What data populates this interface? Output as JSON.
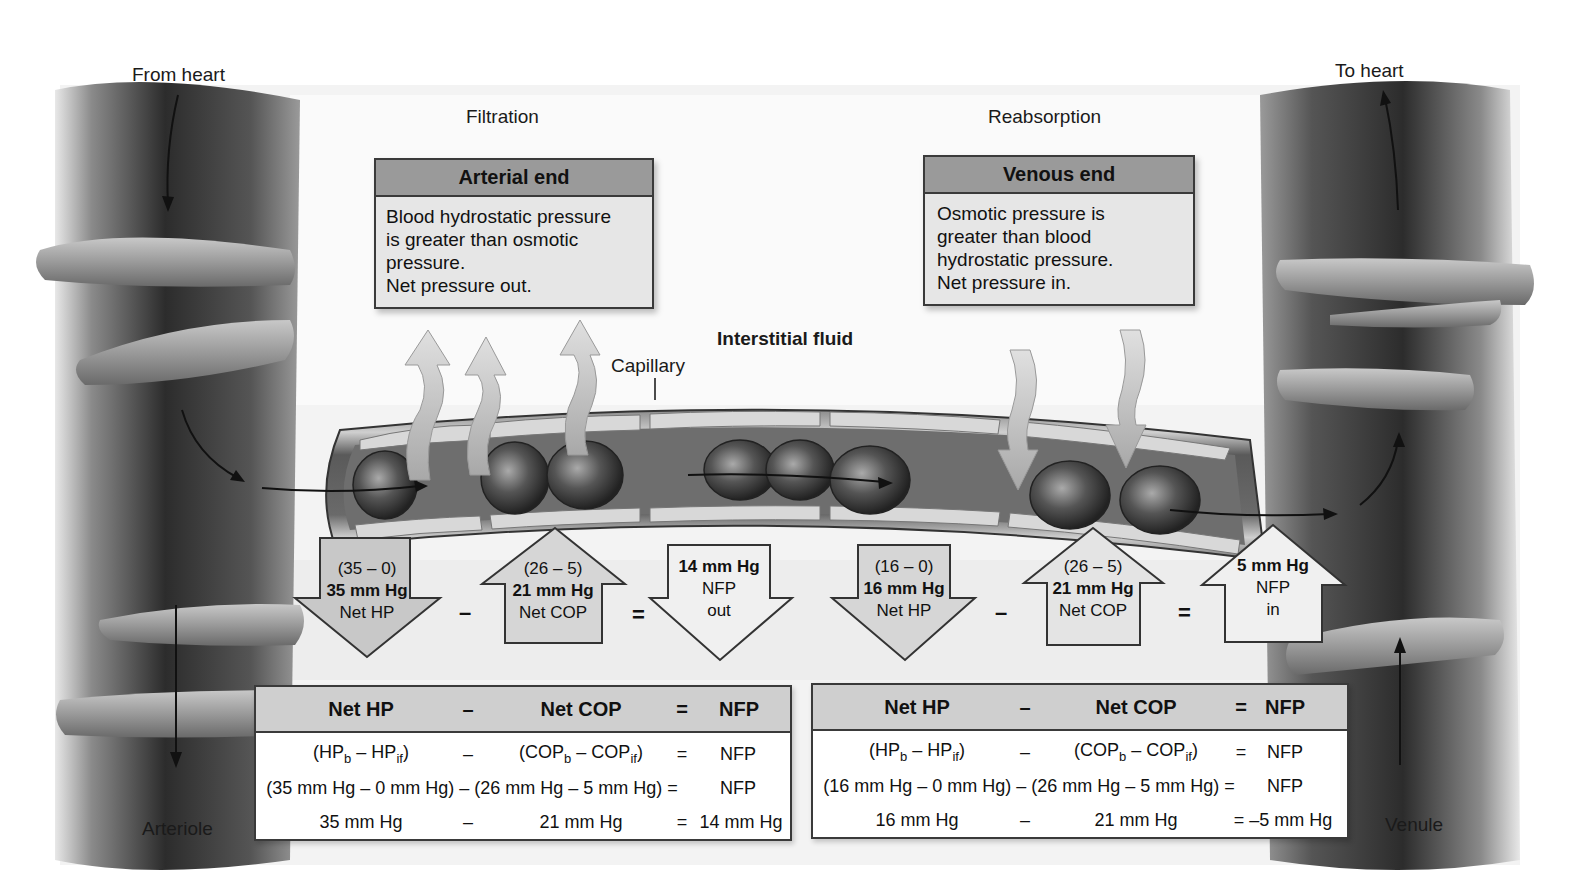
{
  "labels": {
    "from_heart": "From heart",
    "to_heart": "To heart",
    "filtration": "Filtration",
    "reabsorption": "Reabsorption",
    "interstitial_fluid": "Interstitial fluid",
    "capillary": "Capillary",
    "arteriole": "Arteriole",
    "venule": "Venule"
  },
  "arterial_box": {
    "title": "Arterial end",
    "lines": [
      "Blood hydrostatic pressure",
      "is greater than osmotic",
      "pressure.",
      "Net pressure out."
    ]
  },
  "venous_box": {
    "title": "Venous end",
    "lines": [
      "Osmotic pressure is",
      "greater than blood",
      "hydrostatic pressure.",
      "Net pressure in."
    ]
  },
  "arterial_arrows": [
    {
      "direction": "down",
      "line1": "(35 – 0)",
      "line2": "35 mm Hg",
      "line3": "Net HP"
    },
    {
      "direction": "up",
      "line1": "(26 – 5)",
      "line2": "21 mm Hg",
      "line3": "Net COP"
    },
    {
      "direction": "down",
      "line1": "14 mm Hg",
      "line2": "NFP",
      "line3": "out"
    }
  ],
  "venous_arrows": [
    {
      "direction": "down",
      "line1": "(16 – 0)",
      "line2": "16 mm Hg",
      "line3": "Net HP"
    },
    {
      "direction": "up",
      "line1": "(26 – 5)",
      "line2": "21 mm Hg",
      "line3": "Net COP"
    },
    {
      "direction": "up",
      "line1": "5 mm Hg",
      "line2": "NFP",
      "line3": "in"
    }
  ],
  "operators": {
    "minus": "–",
    "equals": "="
  },
  "arterial_table": {
    "header": {
      "c1": "Net HP",
      "op1": "–",
      "c2": "Net COP",
      "op2": "=",
      "c3": "NFP"
    },
    "row1": {
      "c1a": "(HP",
      "c1sub1": "b",
      "c1b": " – HP",
      "c1sub2": "if",
      "c1c": ")",
      "op1": "–",
      "c2a": "(COP",
      "c2sub1": "b",
      "c2b": " – COP",
      "c2sub2": "if",
      "c2c": ")",
      "op2": "=",
      "c3": "NFP"
    },
    "row2": "(35 mm Hg – 0 mm Hg) – (26 mm Hg – 5 mm Hg) =",
    "row2_result": "NFP",
    "row3": {
      "c1": "35 mm Hg",
      "op1": "–",
      "c2": "21 mm Hg",
      "op2": "=",
      "c3": "14 mm Hg"
    }
  },
  "venous_table": {
    "header": {
      "c1": "Net HP",
      "op1": "–",
      "c2": "Net COP",
      "op2": "=",
      "c3": "NFP"
    },
    "row1": {
      "c1a": "(HP",
      "c1sub1": "b",
      "c1b": " – HP",
      "c1sub2": "if",
      "c1c": ")",
      "op1": "–",
      "c2a": "(COP",
      "c2sub1": "b",
      "c2b": " – COP",
      "c2sub2": "if",
      "c2c": ")",
      "op2": "=",
      "c3": "NFP"
    },
    "row2": "(16 mm Hg – 0 mm Hg) – (26 mm Hg – 5 mm Hg) =",
    "row2_result": "NFP",
    "row3": {
      "c1": "16 mm Hg",
      "op1": "–",
      "c2": "21 mm Hg",
      "op2": "=",
      "c3": "–5 mm Hg"
    }
  },
  "colors": {
    "vessel_dark": "#3c3c3c",
    "vessel_light": "#9a9a9a",
    "box_header": "#9a9a9a",
    "box_body": "#e6e6e6",
    "arrow_fill": "#d8d8d8",
    "table_header": "#cfcfcf"
  }
}
